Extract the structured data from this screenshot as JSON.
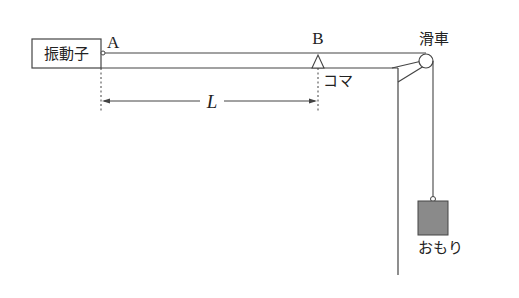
{
  "diagram": {
    "labels": {
      "vibrator": "振動子",
      "point_a": "A",
      "point_b": "B",
      "pulley": "滑車",
      "bridge": "コマ",
      "length": "L",
      "weight": "おもり"
    },
    "colors": {
      "line": "#444444",
      "weight_fill": "#8a8a8a",
      "background": "#ffffff"
    }
  }
}
